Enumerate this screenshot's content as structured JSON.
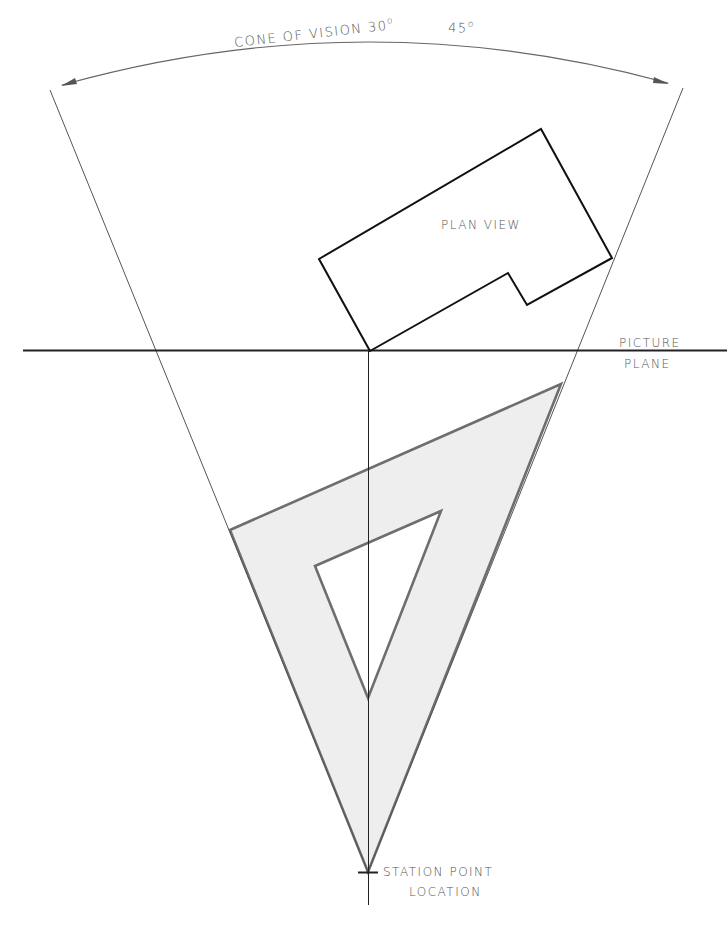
{
  "diagram": {
    "type": "perspective-drawing-setup",
    "labels": {
      "cone_of_vision": "CONE OF VISION 30",
      "cone_deg_sup": "o",
      "cone_alt": "45",
      "cone_alt_sup": "o",
      "plan_view": "PLAN VIEW",
      "picture_plane_line1": "PICTURE",
      "picture_plane_line2": "PLANE",
      "station_point_line1": "STATION POINT",
      "station_point_line2": "LOCATION"
    },
    "elements": [
      {
        "name": "cone-of-vision",
        "description": "Two rays from station point bounding the cone with arc dimension at top"
      },
      {
        "name": "plan-view",
        "description": "L-shaped building outline rotated, corner touching picture plane"
      },
      {
        "name": "picture-plane",
        "description": "Horizontal line across the drawing"
      },
      {
        "name": "triangle-45",
        "description": "Shaded 45-degree drafting triangle with triangular cutout, apex at station point"
      },
      {
        "name": "central-line-of-sight",
        "description": "Vertical line from plan corner through station point"
      }
    ],
    "colors": {
      "line": "#111111",
      "thin_line": "#555555",
      "triangle_fill": "#eeeeee",
      "triangle_stroke": "#6a6a6a",
      "text": "#555555"
    }
  }
}
